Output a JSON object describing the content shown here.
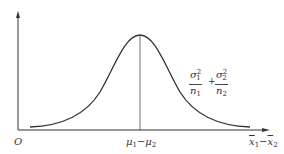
{
  "diagram": {
    "type": "normal-distribution-curve",
    "origin_label": "O",
    "center_label": {
      "mu": "μ",
      "sub1": "1",
      "minus": "−",
      "mu2": "μ",
      "sub2": "2"
    },
    "x_axis_label": {
      "x1": "x",
      "sub1": "1",
      "minus": "−",
      "x2": "x",
      "sub2": "2"
    },
    "variance_label": {
      "term1": {
        "numerator": "σ",
        "num_sup": "2",
        "num_sub": "1",
        "denominator": "n",
        "den_sub": "1"
      },
      "plus": "+",
      "term2": {
        "numerator": "σ",
        "num_sup": "2",
        "num_sub": "2",
        "denominator": "n",
        "den_sub": "2"
      }
    },
    "colors": {
      "curve": "#333333",
      "axes": "#333333",
      "background": "#ffffff"
    }
  }
}
